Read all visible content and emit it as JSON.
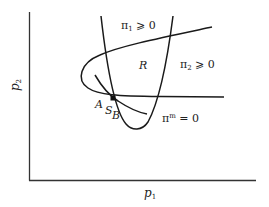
{
  "diagram": {
    "axes": {
      "x_label": "p",
      "x_label_sub": "1",
      "y_label": "p",
      "y_label_sub": "2"
    },
    "curves": [
      {
        "id": "pi1-boundary",
        "label_symbol": "π",
        "label_sub": "1",
        "label_rest": " ⩾ 0"
      },
      {
        "id": "pi2-boundary",
        "label_symbol": "π",
        "label_sub": "2",
        "label_rest": " ⩾ 0"
      },
      {
        "id": "pim-curve",
        "label_symbol": "π",
        "label_sup": "m",
        "label_rest": " = 0"
      }
    ],
    "region_label": "R",
    "points": {
      "a": "A",
      "s": "S",
      "b": "B"
    },
    "colors": {
      "line": "#1a1a1a",
      "axis": "#333333",
      "text": "#222222",
      "background": "#ffffff"
    }
  }
}
